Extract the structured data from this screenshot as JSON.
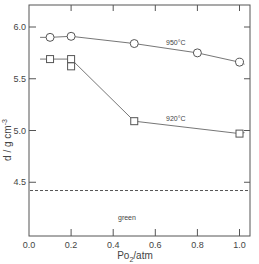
{
  "chart_data": {
    "type": "line",
    "title": "",
    "xlabel": "Po2/atm",
    "ylabel": "d / g cm-3",
    "xlim": [
      0.0,
      1.05
    ],
    "ylim": [
      4.0,
      6.2
    ],
    "x_ticks": [
      0.0,
      0.2,
      0.4,
      0.6,
      0.8,
      1.0
    ],
    "x_tick_labels": [
      "0.0",
      "0.2",
      "0.4",
      "0.6",
      "0.8",
      "1.0"
    ],
    "y_ticks": [
      4.5,
      5.0,
      5.5,
      6.0
    ],
    "y_tick_labels": [
      "4.5",
      "5.0",
      "5.5",
      "6.0"
    ],
    "grid": false,
    "legend": null,
    "series": [
      {
        "name": "950°C",
        "marker": "circle",
        "x": [
          0.1,
          0.2,
          0.5,
          0.8,
          1.0
        ],
        "y": [
          5.9,
          5.91,
          5.84,
          5.75,
          5.66
        ]
      },
      {
        "name": "920°C",
        "marker": "square",
        "x": [
          0.1,
          0.2,
          0.2,
          0.5,
          1.0
        ],
        "y": [
          5.69,
          5.69,
          5.62,
          5.09,
          4.97
        ]
      }
    ],
    "reference_lines": [
      {
        "label": "green",
        "y": 4.42,
        "style": "dashed"
      }
    ],
    "annotations": [
      {
        "text": "950°C",
        "x": 0.62,
        "y": 5.9
      },
      {
        "text": "920°C",
        "x": 0.62,
        "y": 5.12
      },
      {
        "text": "green",
        "x": 0.38,
        "y": 4.46
      }
    ]
  },
  "labels": {
    "ylabel_main": "d / g cm",
    "ylabel_sup": "-3",
    "xlabel_main": "Po",
    "xlabel_sub": "2",
    "xlabel_rest": "/atm",
    "series_950": "950°C",
    "series_920": "920°C",
    "green": "green"
  }
}
